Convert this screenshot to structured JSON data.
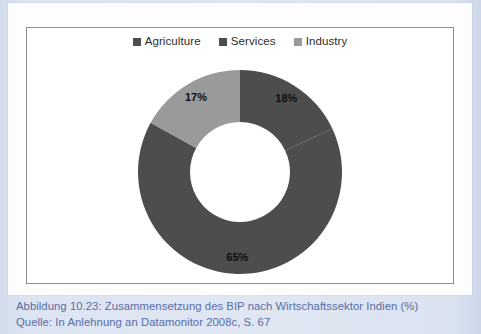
{
  "figure": {
    "caption_line_1": "Abbildung 10.23:  Zusammensetzung des BIP nach Wirtschaftssektor Indien (%)",
    "caption_line_2": "Quelle: In Anlehnung an Datamonitor 2008c, S. 67"
  },
  "legend": {
    "items": [
      {
        "label": "Agriculture",
        "color": "#4d4d4d",
        "swatch_icon": "square-swatch-icon"
      },
      {
        "label": "Services",
        "color": "#4d4d4d",
        "swatch_icon": "square-swatch-icon"
      },
      {
        "label": "Industry",
        "color": "#9a9a9a",
        "swatch_icon": "square-swatch-icon"
      }
    ]
  },
  "chart_data": {
    "type": "pie",
    "variant": "donut",
    "title": "Zusammensetzung des BIP nach Wirtschaftssektor Indien (%)",
    "unit": "%",
    "categories": [
      "Agriculture",
      "Services",
      "Industry"
    ],
    "values": [
      18,
      65,
      17
    ],
    "labels": [
      "18%",
      "65%",
      "17%"
    ],
    "colors": [
      "#4d4d4d",
      "#4d4d4d",
      "#9a9a9a"
    ],
    "start_angle_deg": 0,
    "direction": "clockwise",
    "inner_radius_ratio": 0.49,
    "legend_position": "top",
    "grid": false,
    "xlabel": "",
    "ylabel": ""
  },
  "colors": {
    "page_background": "#dce4f0",
    "card_background": "#fdfdfd",
    "frame_border": "#8d8d8d",
    "caption_text": "#5a6ea6",
    "dark_slice": "#4d4d4d",
    "light_slice": "#9a9a9a"
  }
}
